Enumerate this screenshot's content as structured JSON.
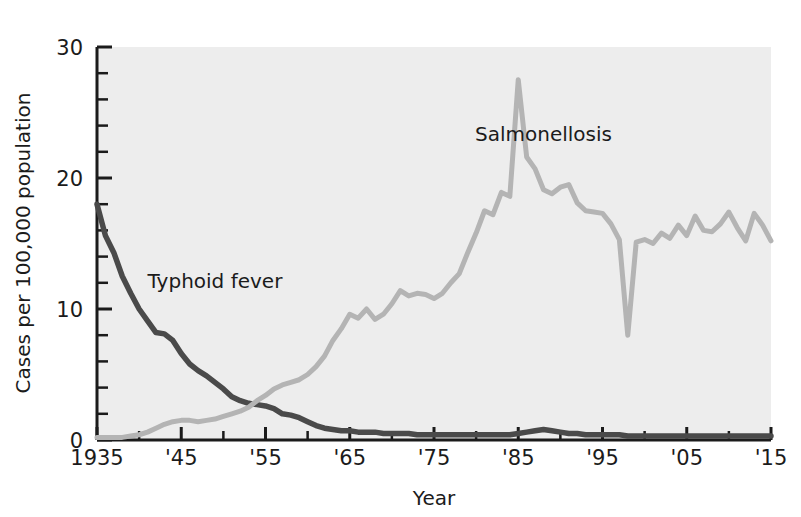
{
  "chart_data": {
    "type": "line",
    "title": "",
    "subtitle": "",
    "xlabel": "Year",
    "ylabel": "Cases per 100,000 population",
    "xlim": [
      1935,
      2015
    ],
    "ylim": [
      0,
      30
    ],
    "grid": false,
    "legend_position": "inline-annotation",
    "background_color": "#ededed",
    "page_background_color": "#ffffff",
    "axis_color": "#1b1b1b",
    "x_tick_labels": [
      "1935",
      "'45",
      "'55",
      "'65",
      "'75",
      "'85",
      "'95",
      "'05",
      "'15"
    ],
    "x_tick_values": [
      1935,
      1945,
      1955,
      1965,
      1975,
      1985,
      1995,
      2005,
      2015
    ],
    "x_minor_tick_interval": 5,
    "y_tick_labels": [
      "0",
      "10",
      "20",
      "30"
    ],
    "y_tick_values": [
      0,
      10,
      20,
      30
    ],
    "y_minor_tick_interval": 2,
    "annotations": [
      {
        "text": "Typhoid fever",
        "x": 1949,
        "y": 11.6
      },
      {
        "text": "Salmonellosis",
        "x": 1988,
        "y": 22.8
      }
    ],
    "series": [
      {
        "name": "Typhoid fever",
        "color": "#4a4a4a",
        "label": "Typhoid fever",
        "x": [
          1935,
          1936,
          1937,
          1938,
          1939,
          1940,
          1941,
          1942,
          1943,
          1944,
          1945,
          1946,
          1947,
          1948,
          1949,
          1950,
          1951,
          1952,
          1953,
          1954,
          1955,
          1956,
          1957,
          1958,
          1959,
          1960,
          1961,
          1962,
          1963,
          1964,
          1965,
          1966,
          1967,
          1968,
          1969,
          1970,
          1971,
          1972,
          1973,
          1974,
          1975,
          1976,
          1977,
          1978,
          1979,
          1980,
          1981,
          1982,
          1983,
          1984,
          1985,
          1986,
          1987,
          1988,
          1989,
          1990,
          1991,
          1992,
          1993,
          1994,
          1995,
          1996,
          1997,
          1998,
          1999,
          2000,
          2001,
          2002,
          2003,
          2004,
          2005,
          2006,
          2007,
          2008,
          2009,
          2010,
          2011,
          2012,
          2013,
          2014,
          2015
        ],
        "values": [
          18.0,
          15.6,
          14.3,
          12.5,
          11.2,
          10.0,
          9.1,
          8.2,
          8.1,
          7.6,
          6.6,
          5.8,
          5.3,
          4.9,
          4.4,
          3.9,
          3.3,
          3.0,
          2.8,
          2.7,
          2.6,
          2.4,
          2.0,
          1.9,
          1.7,
          1.4,
          1.1,
          0.9,
          0.8,
          0.7,
          0.7,
          0.6,
          0.6,
          0.6,
          0.5,
          0.5,
          0.5,
          0.5,
          0.4,
          0.4,
          0.4,
          0.4,
          0.4,
          0.4,
          0.4,
          0.4,
          0.4,
          0.4,
          0.4,
          0.4,
          0.5,
          0.6,
          0.7,
          0.8,
          0.7,
          0.6,
          0.5,
          0.5,
          0.4,
          0.4,
          0.4,
          0.4,
          0.4,
          0.3,
          0.3,
          0.3,
          0.3,
          0.3,
          0.3,
          0.3,
          0.3,
          0.3,
          0.3,
          0.3,
          0.3,
          0.3,
          0.3,
          0.3,
          0.3,
          0.3,
          0.3
        ]
      },
      {
        "name": "Salmonellosis",
        "color": "#b4b4b4",
        "label": "Salmonellosis",
        "x": [
          1935,
          1936,
          1937,
          1938,
          1939,
          1940,
          1941,
          1942,
          1943,
          1944,
          1945,
          1946,
          1947,
          1948,
          1949,
          1950,
          1951,
          1952,
          1953,
          1954,
          1955,
          1956,
          1957,
          1958,
          1959,
          1960,
          1961,
          1962,
          1963,
          1964,
          1965,
          1966,
          1967,
          1968,
          1969,
          1970,
          1971,
          1972,
          1973,
          1974,
          1975,
          1976,
          1977,
          1978,
          1979,
          1980,
          1981,
          1982,
          1983,
          1984,
          1985,
          1986,
          1987,
          1988,
          1989,
          1990,
          1991,
          1992,
          1993,
          1994,
          1995,
          1996,
          1997,
          1998,
          1999,
          2000,
          2001,
          2002,
          2003,
          2004,
          2005,
          2006,
          2007,
          2008,
          2009,
          2010,
          2011,
          2012,
          2013,
          2014,
          2015
        ],
        "values": [
          0.2,
          0.2,
          0.2,
          0.2,
          0.3,
          0.4,
          0.6,
          0.9,
          1.2,
          1.4,
          1.5,
          1.5,
          1.4,
          1.5,
          1.6,
          1.8,
          2.0,
          2.2,
          2.5,
          3.0,
          3.4,
          3.9,
          4.2,
          4.4,
          4.6,
          5.0,
          5.6,
          6.4,
          7.6,
          8.5,
          9.6,
          9.3,
          10.0,
          9.2,
          9.6,
          10.4,
          11.4,
          11.0,
          11.2,
          11.1,
          10.8,
          11.2,
          12.0,
          12.7,
          14.3,
          15.8,
          17.5,
          17.2,
          18.9,
          18.6,
          27.5,
          21.6,
          20.7,
          19.1,
          18.8,
          19.3,
          19.5,
          18.1,
          17.5,
          17.4,
          17.3,
          16.5,
          15.3,
          8.0,
          15.1,
          15.3,
          15.0,
          15.8,
          15.4,
          16.4,
          15.6,
          17.1,
          16.0,
          15.9,
          16.5,
          17.4,
          16.2,
          15.2,
          17.3,
          16.4,
          15.2
        ]
      }
    ]
  },
  "axes": {
    "x_title": "Year",
    "y_title": "Cases per 100,000 population"
  }
}
